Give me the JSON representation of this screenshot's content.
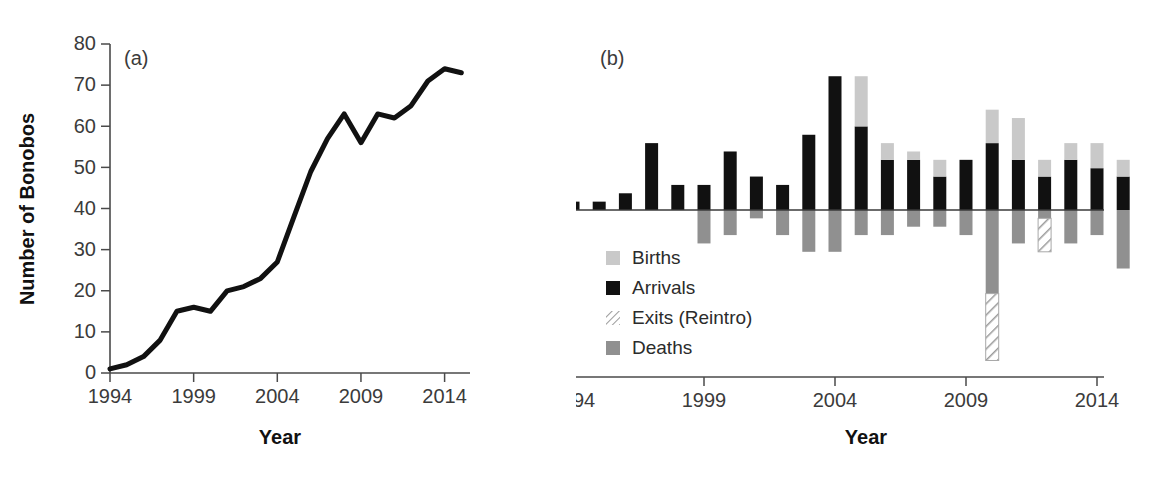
{
  "figure": {
    "panels": [
      {
        "tag": "(a)",
        "ylabel": "Number of Bonobos",
        "xlabel": "Year"
      },
      {
        "tag": "(b)",
        "ylabel": "Number of Events",
        "xlabel": "Year"
      }
    ]
  },
  "colors": {
    "births": "#c9c9c9",
    "arrivals": "#111111",
    "exits": "#ffffff",
    "exits_stroke": "#8a8a8a",
    "deaths": "#909090",
    "axis": "#4a4a4a",
    "line": "#111111"
  },
  "chart_data": [
    {
      "type": "line",
      "panel": "(a)",
      "title": "",
      "xlabel": "Year",
      "ylabel": "Number of Bonobos",
      "xlim": [
        1994,
        2015
      ],
      "ylim": [
        0,
        80
      ],
      "xticks": [
        1994,
        1999,
        2004,
        2009,
        2014
      ],
      "xticklabels": [
        "1994",
        "1999",
        "2004",
        "2009",
        "2014"
      ],
      "yticks": [
        0,
        10,
        20,
        30,
        40,
        50,
        60,
        70,
        80
      ],
      "yticklabels": [
        "0",
        "10",
        "20",
        "30",
        "40",
        "50",
        "60",
        "70",
        "80"
      ],
      "grid": false,
      "legend": "none",
      "x": [
        1994,
        1995,
        1996,
        1997,
        1998,
        1999,
        2000,
        2001,
        2002,
        2003,
        2004,
        2005,
        2006,
        2007,
        2008,
        2009,
        2010,
        2011,
        2012,
        2013,
        2014,
        2015
      ],
      "values": [
        1,
        2,
        4,
        8,
        15,
        16,
        15,
        20,
        21,
        23,
        27,
        38,
        49,
        57,
        63,
        56,
        63,
        62,
        65,
        71,
        74,
        73
      ]
    },
    {
      "type": "bar",
      "panel": "(b)",
      "title": "",
      "xlabel": "Year",
      "ylabel": "Number of Events",
      "xlim": [
        1993.5,
        2015.5
      ],
      "ylim": [
        -20,
        20
      ],
      "xticks": [
        1994,
        1999,
        2004,
        2009,
        2014
      ],
      "xticklabels": [
        "1994",
        "1999",
        "2004",
        "2009",
        "2014"
      ],
      "yticks": [
        20,
        15,
        10,
        5,
        0,
        -5,
        -10,
        -15,
        -20
      ],
      "yticklabels": [
        "20",
        "15",
        "10",
        "5",
        "0",
        "−5",
        "−10",
        "−15",
        "−20"
      ],
      "grid": false,
      "stacked": true,
      "legend_position": "lower-left",
      "categories": [
        1994,
        1995,
        1996,
        1997,
        1998,
        1999,
        2000,
        2001,
        2002,
        2003,
        2004,
        2005,
        2006,
        2007,
        2008,
        2009,
        2010,
        2011,
        2012,
        2013,
        2014,
        2015
      ],
      "series": [
        {
          "name": "Births",
          "color": "#c9c9c9",
          "direction": "up",
          "values": [
            0,
            0,
            0,
            0,
            0,
            0,
            0,
            0,
            0,
            0,
            0,
            6,
            2,
            1,
            2,
            0,
            4,
            5,
            2,
            2,
            3,
            2
          ]
        },
        {
          "name": "Arrivals",
          "color": "#111111",
          "direction": "up",
          "values": [
            1,
            1,
            2,
            8,
            3,
            3,
            7,
            4,
            3,
            9,
            16,
            10,
            6,
            6,
            4,
            6,
            8,
            6,
            4,
            6,
            5,
            4
          ]
        },
        {
          "name": "Exits (Reintro)",
          "color": "#ffffff",
          "direction": "down",
          "values": [
            0,
            0,
            0,
            0,
            0,
            0,
            0,
            0,
            0,
            0,
            0,
            0,
            0,
            0,
            0,
            0,
            8,
            0,
            4,
            0,
            0,
            0
          ]
        },
        {
          "name": "Deaths",
          "color": "#909090",
          "direction": "down",
          "values": [
            0,
            0,
            0,
            0,
            0,
            4,
            3,
            1,
            3,
            5,
            5,
            3,
            3,
            2,
            2,
            3,
            10,
            4,
            1,
            4,
            3,
            7
          ]
        }
      ],
      "legend_entries": [
        {
          "label": "Births",
          "swatch": "births"
        },
        {
          "label": "Arrivals",
          "swatch": "arrivals"
        },
        {
          "label": "Exits (Reintro)",
          "swatch": "exits"
        },
        {
          "label": "Deaths",
          "swatch": "deaths"
        }
      ]
    }
  ]
}
